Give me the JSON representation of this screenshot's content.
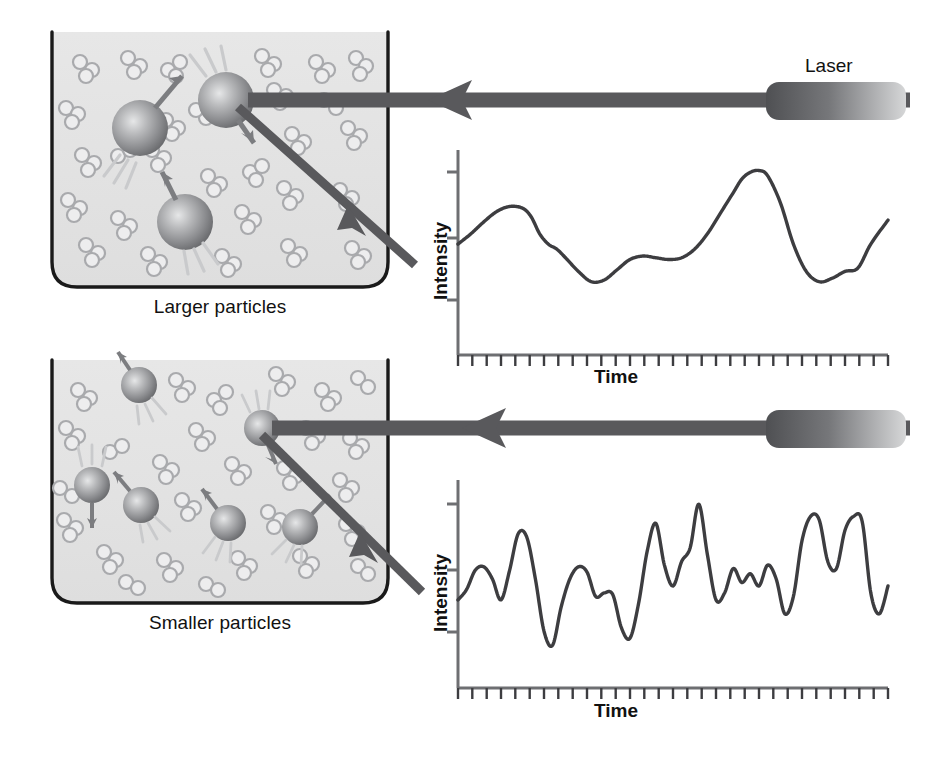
{
  "figure": {
    "background": "#ffffff"
  },
  "colors": {
    "cuvette_fill": "#e3e3e3",
    "cuvette_stroke": "#1a1a1a",
    "beam": "#59595c",
    "particle_dark": "#6f7073",
    "particle_light": "#d8d9da",
    "molecule_fill": "#ededee",
    "molecule_stroke": "#a9aaad",
    "axis": "#6e6f72",
    "trace": "#3d3d40",
    "text": "#111111",
    "laser_dark": "#58585b",
    "laser_light": "#d2d3d4"
  },
  "panels": [
    {
      "id": "top",
      "caption": "Larger particles",
      "laser_label": "Laser",
      "cuvette": {
        "x": 52,
        "y": 32,
        "w": 336,
        "h": 255
      },
      "chart": {
        "ylabel": "Intensity",
        "xlabel": "Time",
        "y_tick_count": 3,
        "x_tick_count": 30,
        "axis_x": 458,
        "axis_top": 150,
        "axis_bottom": 355,
        "axis_right": 888
      }
    },
    {
      "id": "bottom",
      "caption": "Smaller particles",
      "laser_label": "",
      "cuvette": {
        "x": 52,
        "y": 360,
        "w": 336,
        "h": 243
      },
      "chart": {
        "ylabel": "Intensity",
        "xlabel": "Time",
        "y_tick_count": 3,
        "x_tick_count": 30,
        "axis_x": 458,
        "axis_top": 480,
        "axis_bottom": 688,
        "axis_right": 888
      }
    }
  ],
  "chart_data": [
    {
      "type": "line",
      "id": "larger-particles-trace",
      "title": "Intensity fluctuation for larger particles",
      "xlabel": "Time",
      "ylabel": "Intensity",
      "xlim": [
        0,
        100
      ],
      "ylim": [
        0,
        100
      ],
      "grid": false,
      "legend": false,
      "description": "Slow, smooth, low-frequency intensity fluctuations characteristic of slowly diffusing large particles",
      "x": [
        0,
        3,
        6,
        9,
        12,
        15,
        17,
        19,
        21,
        23,
        25,
        28,
        31,
        34,
        37,
        40,
        43,
        46,
        49,
        52,
        55,
        58,
        61,
        64,
        66,
        68,
        70,
        72,
        75,
        78,
        81,
        84,
        87,
        90,
        93,
        96,
        100
      ],
      "y": [
        52,
        58,
        65,
        71,
        74,
        73,
        68,
        58,
        52,
        49,
        44,
        36,
        30,
        31,
        37,
        43,
        45,
        44,
        43,
        44,
        49,
        58,
        70,
        82,
        90,
        94,
        95,
        92,
        76,
        52,
        36,
        30,
        32,
        36,
        38,
        52,
        66
      ]
    },
    {
      "type": "line",
      "id": "smaller-particles-trace",
      "title": "Intensity fluctuation for smaller particles",
      "xlabel": "Time",
      "ylabel": "Intensity",
      "xlim": [
        0,
        100
      ],
      "ylim": [
        0,
        100
      ],
      "grid": false,
      "legend": false,
      "description": "Rapid, high-frequency intensity fluctuations characteristic of fast diffusing small particles",
      "x": [
        0,
        2,
        4,
        6,
        8,
        10,
        12,
        14,
        16,
        18,
        20,
        22,
        24,
        26,
        28,
        30,
        32,
        34,
        36,
        38,
        40,
        42,
        44,
        46,
        48,
        50,
        52,
        54,
        56,
        58,
        60,
        62,
        64,
        66,
        68,
        70,
        72,
        74,
        76,
        78,
        80,
        82,
        84,
        86,
        88,
        90,
        92,
        94,
        96,
        98,
        100
      ],
      "y": [
        38,
        44,
        55,
        57,
        50,
        38,
        55,
        76,
        74,
        50,
        20,
        12,
        34,
        50,
        57,
        54,
        40,
        42,
        41,
        22,
        16,
        36,
        66,
        82,
        58,
        46,
        60,
        68,
        93,
        64,
        38,
        42,
        56,
        48,
        53,
        46,
        58,
        50,
        30,
        40,
        72,
        86,
        84,
        60,
        56,
        78,
        86,
        83,
        42,
        30,
        46
      ]
    }
  ],
  "particles": {
    "top": [
      {
        "cx": 140,
        "cy": 128,
        "r": 28,
        "arrow": {
          "dx": 30,
          "dy": -34
        },
        "flash": "bl"
      },
      {
        "cx": 226,
        "cy": 100,
        "r": 28,
        "arrow": {
          "dx": 22,
          "dy": 32
        },
        "flash": "tl"
      },
      {
        "cx": 185,
        "cy": 222,
        "r": 28,
        "arrow": {
          "dx": -16,
          "dy": -38
        },
        "flash": "br"
      }
    ],
    "bottom": [
      {
        "cx": 139,
        "cy": 385,
        "r": 18,
        "arrow": {
          "dx": -18,
          "dy": -26
        },
        "flash": "br"
      },
      {
        "cx": 92,
        "cy": 485,
        "r": 18,
        "arrow": {
          "dx": 0,
          "dy": 32
        },
        "flash": "tt"
      },
      {
        "cx": 141,
        "cy": 505,
        "r": 18,
        "arrow": {
          "dx": -22,
          "dy": -26
        },
        "flash": "br"
      },
      {
        "cx": 228,
        "cy": 523,
        "r": 18,
        "arrow": {
          "dx": -20,
          "dy": -28
        },
        "flash": "bl"
      },
      {
        "cx": 300,
        "cy": 527,
        "r": 18,
        "arrow": {
          "dx": 26,
          "dy": -24
        },
        "flash": "bl"
      },
      {
        "cx": 262,
        "cy": 428,
        "r": 18,
        "arrow": {
          "dx": 10,
          "dy": 30
        },
        "flash": "tl"
      }
    ]
  },
  "beams": {
    "top": {
      "incident": {
        "x1": 910,
        "y1": 100,
        "x2": 248,
        "y2": 100,
        "arrow_at": 0.245
      },
      "scattered": {
        "x1": 238,
        "y1": 107,
        "x2": 415,
        "y2": 265,
        "arrow_at": 0.62
      }
    },
    "bottom": {
      "incident": {
        "x1": 910,
        "y1": 428,
        "x2": 272,
        "y2": 428,
        "arrow_at": 0.3
      },
      "scattered": {
        "x1": 262,
        "y1": 435,
        "x2": 422,
        "y2": 592,
        "arrow_at": 0.62
      }
    }
  },
  "lasers": [
    {
      "x": 766,
      "y": 82,
      "w": 140,
      "h": 38,
      "label": "Laser"
    },
    {
      "x": 766,
      "y": 410,
      "w": 140,
      "h": 38,
      "label": ""
    }
  ]
}
